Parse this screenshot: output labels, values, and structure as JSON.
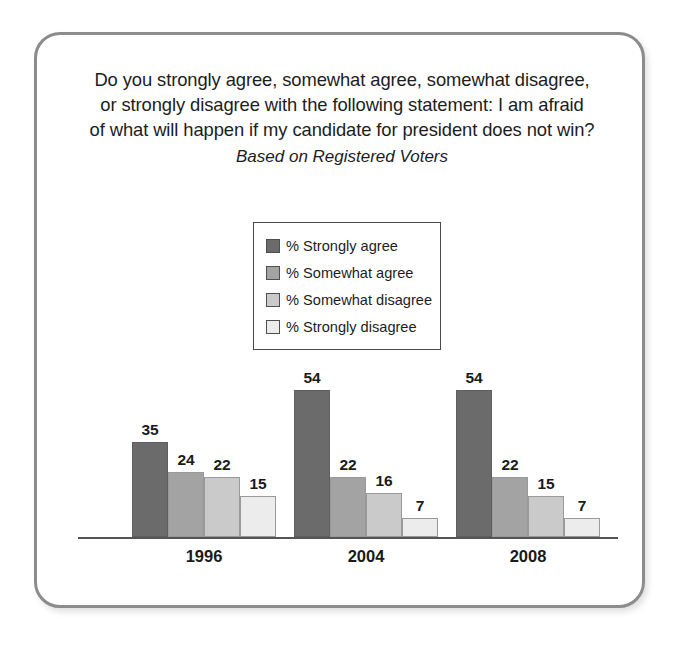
{
  "figure": {
    "frame_border_color": "#8c8c8c",
    "background": "#ffffff"
  },
  "title": {
    "line1": "Do you strongly agree, somewhat agree, somewhat disagree,",
    "line2": "or strongly disagree with the following statement: I am afraid",
    "line3": "of what will happen if my candidate for president does not win?",
    "subtitle": "Based on Registered Voters"
  },
  "legend": {
    "position": "upper-center",
    "items": [
      {
        "label": "% Strongly agree",
        "color": "#6b6b6b"
      },
      {
        "label": "% Somewhat agree",
        "color": "#a3a3a3"
      },
      {
        "label": "% Somewhat disagree",
        "color": "#cacaca"
      },
      {
        "label": "% Strongly disagree",
        "color": "#ececec"
      }
    ]
  },
  "chart_data": {
    "type": "bar",
    "title": "Do you strongly agree, somewhat agree, somewhat disagree, or strongly disagree with the following statement: I am afraid of what will happen if my candidate for president does not win?",
    "subtitle": "Based on Registered Voters",
    "xlabel": "",
    "ylabel": "",
    "ylim": [
      0,
      60
    ],
    "grid": false,
    "legend_position": "upper-center",
    "categories": [
      "1996",
      "2004",
      "2008"
    ],
    "series": [
      {
        "name": "% Strongly agree",
        "color": "#6b6b6b",
        "values": [
          35,
          54,
          54
        ]
      },
      {
        "name": "% Somewhat agree",
        "color": "#a3a3a3",
        "values": [
          24,
          22,
          22
        ]
      },
      {
        "name": "% Somewhat disagree",
        "color": "#cacaca",
        "values": [
          22,
          16,
          15
        ]
      },
      {
        "name": "% Strongly disagree",
        "color": "#ececec",
        "values": [
          15,
          7,
          7
        ]
      }
    ],
    "data_labels": [
      {
        "category": "1996",
        "labels": [
          "35",
          "24",
          "22",
          "15"
        ]
      },
      {
        "category": "2004",
        "labels": [
          "54",
          "22",
          "16",
          "7"
        ]
      },
      {
        "category": "2008",
        "labels": [
          "54",
          "22",
          "15",
          "7"
        ]
      }
    ]
  }
}
